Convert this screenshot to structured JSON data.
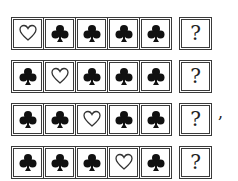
{
  "rows": [
    {
      "cells": [
        "heart",
        "club",
        "club",
        "club",
        "club"
      ],
      "answer": "?"
    },
    {
      "cells": [
        "club",
        "heart",
        "club",
        "club",
        "club"
      ],
      "answer": "?"
    },
    {
      "cells": [
        "club",
        "club",
        "heart",
        "club",
        "club"
      ],
      "answer": "?",
      "trailing": ","
    },
    {
      "cells": [
        "club",
        "club",
        "club",
        "heart",
        "club"
      ],
      "answer": "?"
    }
  ],
  "colors": {
    "club": "#111111",
    "heart_stroke": "#333333",
    "border": "#3a3a3a"
  }
}
